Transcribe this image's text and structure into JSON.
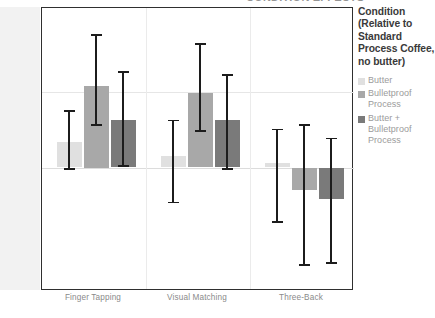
{
  "top_partial_heading": "CONDITION EFFECTS",
  "chart_data": {
    "type": "bar",
    "title": "",
    "xlabel": "",
    "ylabel": "",
    "grid": true,
    "legend_position": "right",
    "ylim": [
      -1.6,
      2.1
    ],
    "zero_reference": 0,
    "categories": [
      "Finger Tapping",
      "Visual Matching",
      "Three-Back"
    ],
    "series": [
      {
        "name": "Butter",
        "color": "#e0e0e0",
        "values": [
          0.34,
          0.15,
          0.06
        ],
        "error_low": [
          -0.02,
          -0.46,
          -0.72
        ],
        "error_high": [
          0.74,
          0.62,
          0.5
        ]
      },
      {
        "name": "Bulletproof Process",
        "color": "#a8a8a8",
        "values": [
          1.08,
          0.98,
          -0.3
        ],
        "error_low": [
          0.56,
          0.48,
          -1.28
        ],
        "error_high": [
          1.74,
          1.63,
          0.56
        ]
      },
      {
        "name": "Butter + Bulletproof Process",
        "color": "#7a7a7a",
        "values": [
          0.62,
          0.62,
          -0.42
        ],
        "error_low": [
          0.02,
          -0.02,
          -1.26
        ],
        "error_high": [
          1.26,
          1.22,
          0.38
        ]
      }
    ]
  },
  "legend": {
    "title": "Condition (Relative to Standard Process Coffee, no butter)",
    "items": [
      {
        "label": "Butter",
        "color": "#e0e0e0"
      },
      {
        "label": "Bulletproof Process",
        "color": "#a8a8a8"
      },
      {
        "label": "Butter + Bulletproof Process",
        "color": "#7a7a7a"
      }
    ]
  },
  "axes": {
    "x_tick_labels": [
      "Finger Tapping",
      "Visual Matching",
      "Three-Back"
    ],
    "y_tick_labels": []
  }
}
